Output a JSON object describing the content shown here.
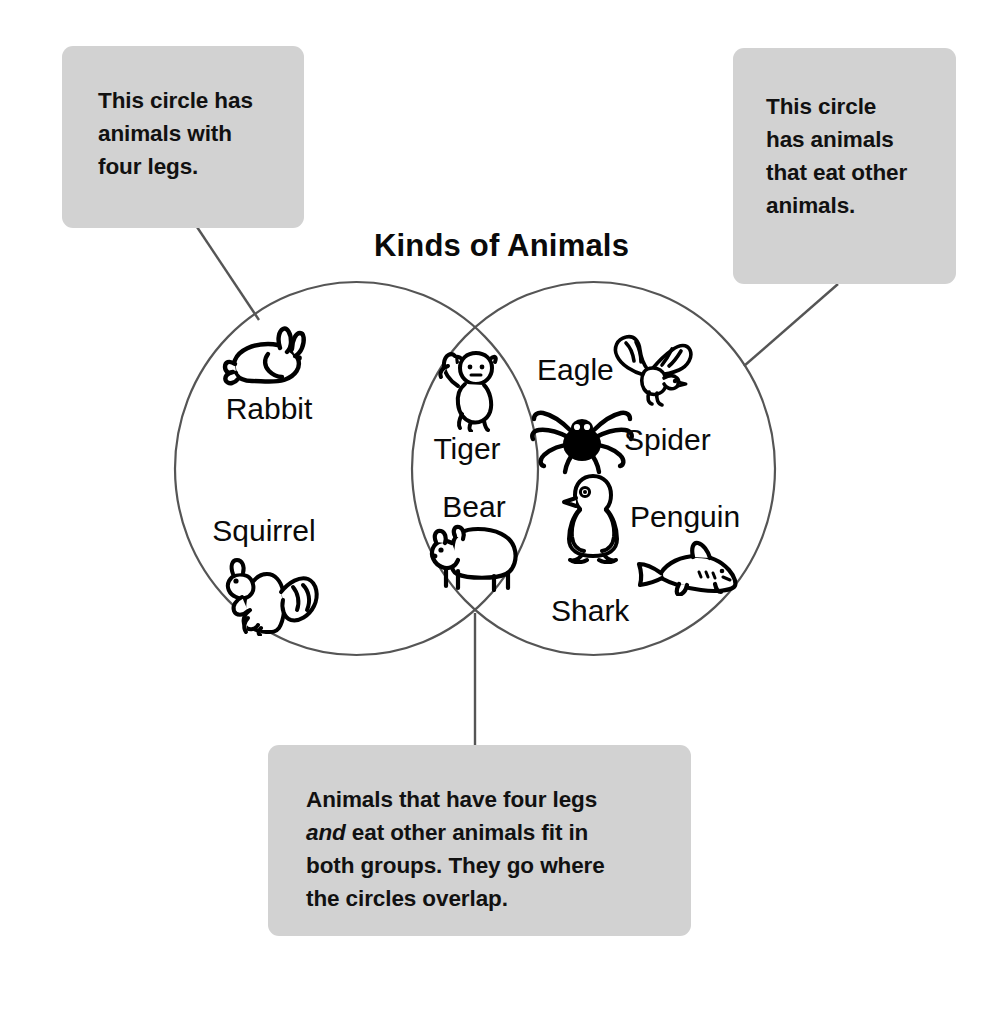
{
  "diagram": {
    "title": "Kinds of Animals",
    "type": "venn-2-circle",
    "left_circle": {
      "criterion": "animals with four legs",
      "items": [
        "Rabbit",
        "Squirrel"
      ]
    },
    "right_circle": {
      "criterion": "animals that eat other animals",
      "items": [
        "Eagle",
        "Spider",
        "Penguin",
        "Shark"
      ]
    },
    "overlap": {
      "criterion": "four legs and eat other animals",
      "items": [
        "Tiger",
        "Bear"
      ]
    }
  },
  "entries": {
    "rabbit": {
      "label": "Rabbit",
      "icon": "rabbit-icon"
    },
    "squirrel": {
      "label": "Squirrel",
      "icon": "squirrel-icon"
    },
    "tiger": {
      "label": "Tiger",
      "icon": "tiger-icon"
    },
    "bear": {
      "label": "Bear",
      "icon": "bear-icon"
    },
    "eagle": {
      "label": "Eagle",
      "icon": "eagle-icon"
    },
    "spider": {
      "label": "Spider",
      "icon": "spider-icon"
    },
    "penguin": {
      "label": "Penguin",
      "icon": "penguin-icon"
    },
    "shark": {
      "label": "Shark",
      "icon": "shark-icon"
    }
  },
  "callouts": {
    "left": {
      "line1": "This circle has",
      "line2": "animals with",
      "line3": "four legs."
    },
    "right": {
      "line1": "This circle",
      "line2": "has animals",
      "line3": "that eat other",
      "line4": "animals."
    },
    "bottom": {
      "line1": "Animals that have four legs",
      "line2_italic": "and",
      "line2_rest": " eat other animals fit in",
      "line3": "both groups. They go where",
      "line4": "the circles overlap."
    }
  },
  "colors": {
    "background": "#ffffff",
    "callout_fill": "#d2d2d2",
    "text": "#0a0a0a",
    "circle_stroke": "#555555",
    "leader_stroke": "#555555",
    "icon_stroke": "#000000"
  }
}
